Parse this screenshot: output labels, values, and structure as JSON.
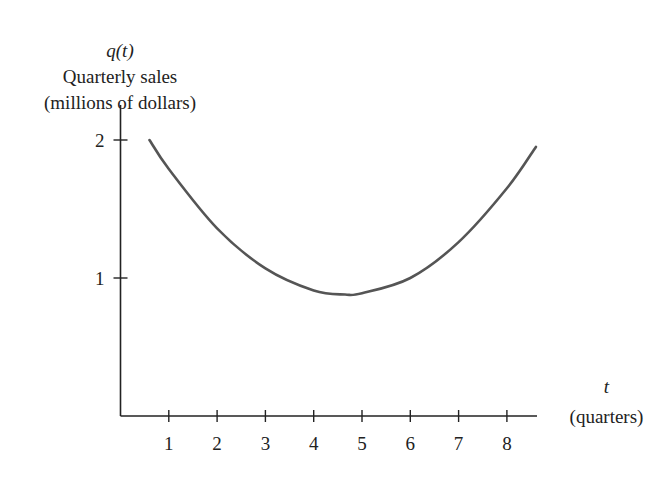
{
  "chart_data": {
    "type": "line",
    "title": "",
    "ylabel_fn": "q(t)",
    "ylabel_line1": "Quarterly sales",
    "ylabel_line2": "(millions of dollars)",
    "xlabel_var": "t",
    "xlabel_unit": "(quarters)",
    "x_ticks": [
      1,
      2,
      3,
      4,
      5,
      6,
      7,
      8
    ],
    "y_ticks": [
      1,
      2
    ],
    "xlim": [
      0,
      8.6
    ],
    "ylim": [
      0,
      2.1
    ],
    "grid": false,
    "legend": null,
    "series": [
      {
        "name": "q(t)",
        "color": "#555555",
        "x": [
          0.6,
          1,
          2,
          3,
          4,
          4.65,
          5,
          6,
          7,
          8,
          8.6
        ],
        "values": [
          2.0,
          1.79,
          1.36,
          1.07,
          0.91,
          0.88,
          0.89,
          1.0,
          1.26,
          1.65,
          1.95
        ]
      }
    ],
    "shape": "U-shaped curve with minimum near t ≈ 4.6 quarters at about 0.88 million dollars"
  },
  "axes": {
    "color": "#222222"
  }
}
